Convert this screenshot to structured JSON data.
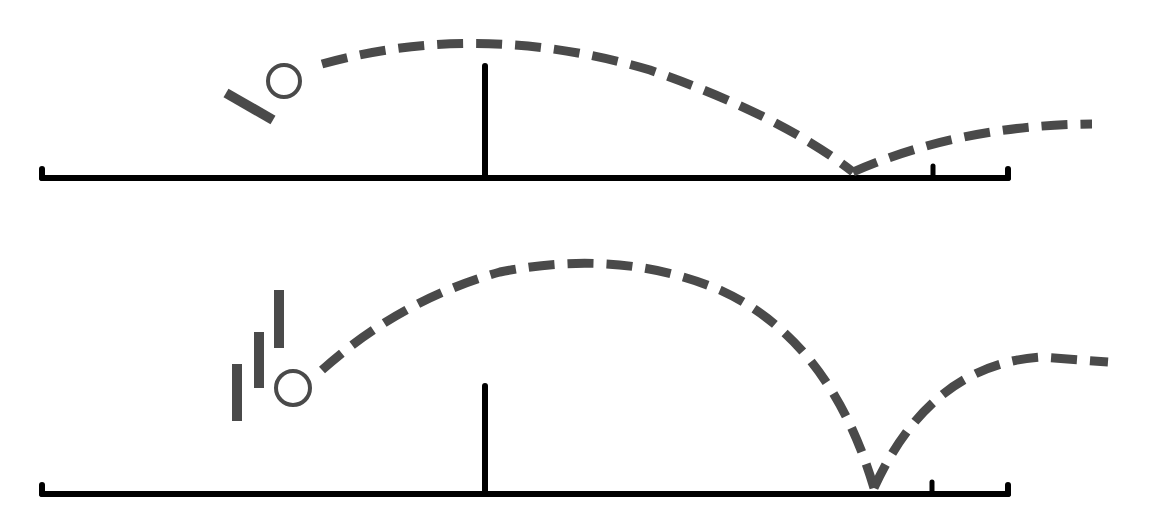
{
  "diagram": {
    "type": "table-tennis-ball-trajectory",
    "colors": {
      "ink": "#000000",
      "trajectory": "#4a4a4a",
      "ball": "#4a4a4a",
      "background": "#ffffff"
    },
    "panels": [
      {
        "id": "top",
        "description": "flat stroke: angled paddle, low trajectory arc, shallow bounce",
        "table": {
          "x1": 42,
          "x2": 1008,
          "y": 178,
          "end_ticks": [
            42,
            1008
          ],
          "mark_x": 933
        },
        "net": {
          "x": 485,
          "top": 66,
          "bottom": 178
        },
        "ball": {
          "cx": 284,
          "cy": 81,
          "r": 16
        },
        "paddle_strokes": [
          {
            "x1": 226,
            "y1": 93,
            "x2": 273,
            "y2": 120
          }
        ],
        "trajectory": {
          "path": "M 322 64 Q 480 20 650 70 Q 780 115 853 172",
          "bounce_path": "M 853 172 Q 960 125 1092 124"
        }
      },
      {
        "id": "bottom",
        "description": "topspin stroke: motion-blur bars, high arc, steep dip, high bounce",
        "table": {
          "x1": 42,
          "x2": 1008,
          "y": 494,
          "end_ticks": [
            42,
            1008
          ],
          "mark_x": 932
        },
        "net": {
          "x": 485,
          "top": 386,
          "bottom": 494
        },
        "ball": {
          "cx": 293,
          "cy": 388,
          "r": 17
        },
        "paddle_strokes": [
          {
            "x1": 237,
            "y1": 364,
            "x2": 237,
            "y2": 421
          },
          {
            "x1": 259,
            "y1": 332,
            "x2": 259,
            "y2": 388
          },
          {
            "x1": 279,
            "y1": 290,
            "x2": 279,
            "y2": 348
          }
        ],
        "trajectory": {
          "path": "M 322 370 Q 400 300 500 272 Q 620 248 720 290 Q 830 340 874 488",
          "bounce_path": "M 874 488 Q 930 365 1040 357 L 1108 362"
        }
      }
    ]
  }
}
